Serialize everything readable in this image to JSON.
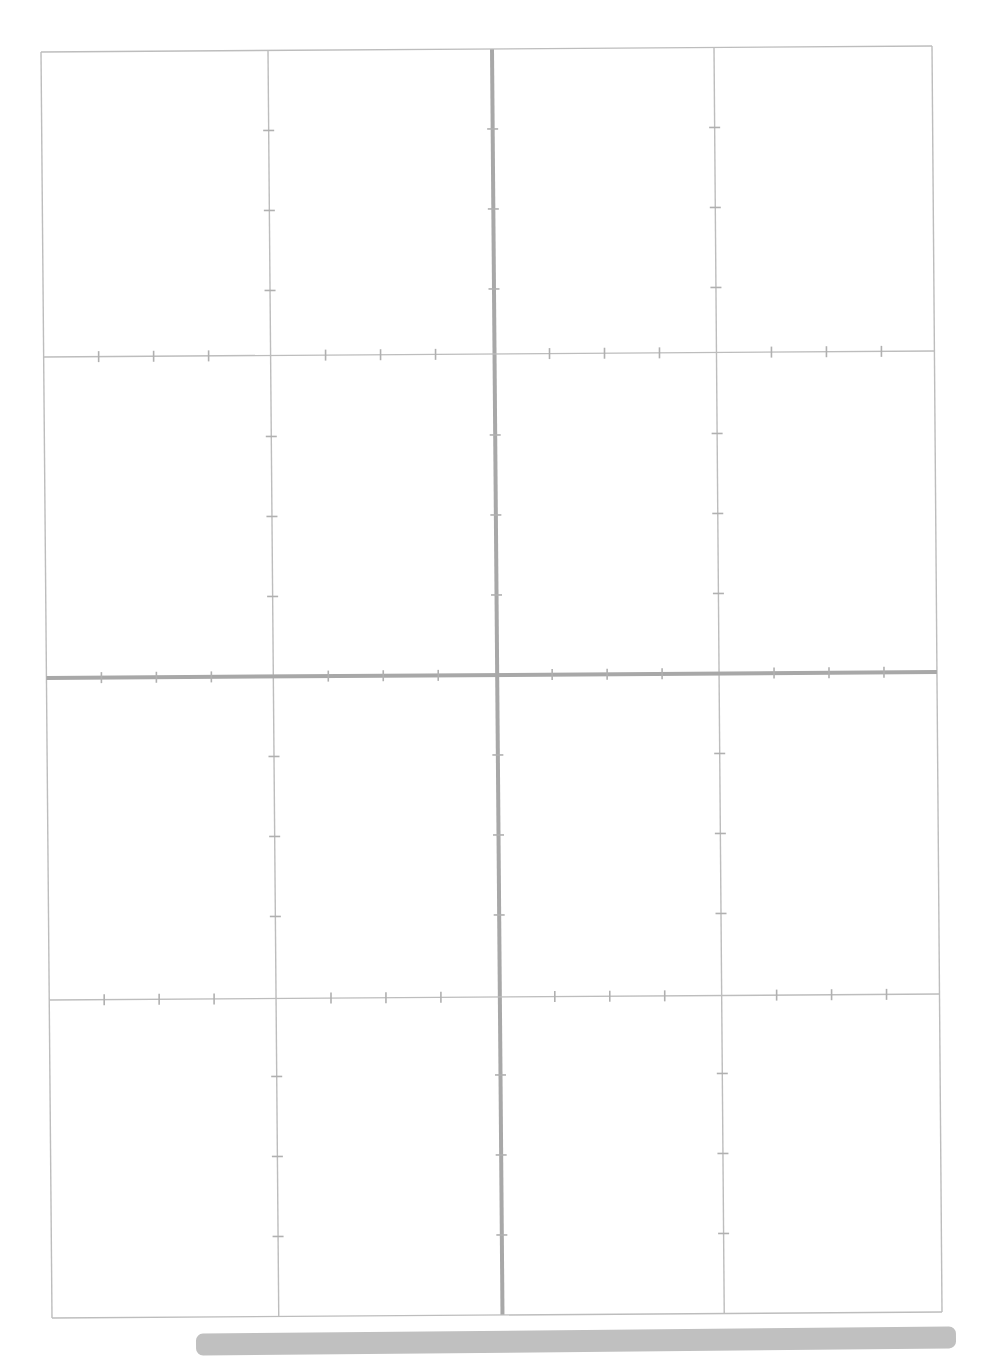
{
  "document": {
    "type": "blank-coordinate-grid-worksheet",
    "title": "",
    "background_color": "#ffffff",
    "page_width": 986,
    "page_height": 1358,
    "scan_skew_degrees": -0.45
  },
  "grid": {
    "label": "Cartesian coordinate grid",
    "border_color": "#b9b9b9",
    "gridline_color": "#bdbdbd",
    "axis_color": "#a8a8a8",
    "tick_color": "#b0b0b0",
    "border_width": 1.4,
    "gridline_width": 1.4,
    "axis_width": 4.0,
    "tick_width": 1.6,
    "tick_length": 11,
    "frame": {
      "top_left": [
        41,
        52
      ],
      "top_right": [
        932,
        46
      ],
      "bottom_right": [
        942,
        1312
      ],
      "bottom_left": [
        52,
        1318
      ]
    },
    "vertical_gridlines_x": [
      41,
      268,
      492,
      714,
      932
    ],
    "horizontal_gridlines_y": [
      52,
      357,
      678,
      1000,
      1318
    ],
    "origin": {
      "x": 492,
      "y": 678
    },
    "axis_vertical_x": 492,
    "axis_horizontal_y": 678,
    "minor_tick_spacing_x": 55,
    "minor_tick_spacing_y": 80,
    "quadrant_count": 4,
    "cells_across": 4,
    "cells_down": 4,
    "tick_x_positions": [
      96,
      151,
      206,
      323,
      378,
      433,
      547,
      602,
      657,
      769,
      824,
      879
    ],
    "tick_y_positions": [
      132,
      212,
      292,
      438,
      518,
      598,
      758,
      838,
      918,
      1078,
      1158,
      1238
    ]
  },
  "bottom_bar": {
    "name": "gray-bar",
    "color": "#c0c0c0",
    "x": 196,
    "y": 1330,
    "width": 760,
    "height": 22,
    "corner_radius": 7,
    "rotation_degrees": -0.55
  },
  "chart_data": {
    "type": "scatter",
    "title": "",
    "subtitle": "",
    "xlabel": "",
    "ylabel": "",
    "series": [],
    "categories": [],
    "values": [],
    "xlim": [
      -4,
      4
    ],
    "ylim": [
      -4,
      4
    ],
    "x_major_ticks": [
      -4,
      -2,
      0,
      2,
      4
    ],
    "y_major_ticks": [
      4,
      2,
      0,
      -2,
      -4
    ],
    "x_tick_labels": [],
    "y_tick_labels": [],
    "minor_ticks_per_major_x": 4,
    "minor_ticks_per_major_y": 4,
    "grid": true,
    "legend": false,
    "legend_position": "none",
    "annotations": [],
    "note": "Empty graph paper — four quadrants, no plotted data, no tick number labels."
  }
}
